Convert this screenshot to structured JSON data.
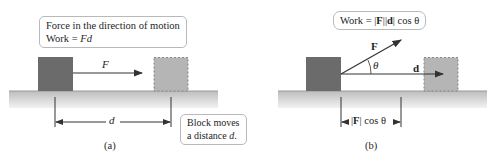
{
  "panel_a": {
    "callout_line1": "Force in the direction of motion",
    "callout_line2_prefix": "Work = ",
    "callout_line2_formula": "Fd",
    "force_label": "F",
    "distance_label": "d",
    "note_line1": "Block moves",
    "note_line2_prefix": "a distance ",
    "note_line2_var": "d",
    "note_line2_suffix": ".",
    "caption": "(a)"
  },
  "panel_b": {
    "callout_prefix": "Work = ",
    "callout_F": "F",
    "callout_d": "d",
    "callout_suffix": " cos θ",
    "force_label": "F",
    "angle_label": "θ",
    "displacement_label": "d",
    "projection_F": "F",
    "projection_suffix": " cos θ",
    "caption": "(b)"
  },
  "colors": {
    "block_solid": "#6b6b6b",
    "block_ghost": "#b5b5b5",
    "ground": "#c4c4c4",
    "border": "#b9b9b9"
  }
}
